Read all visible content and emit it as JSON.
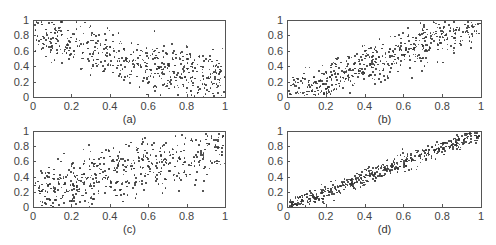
{
  "chart_data": [
    {
      "type": "scatter",
      "caption": "(a)",
      "title": "",
      "xlabel": "",
      "ylabel": "",
      "xlim": [
        0,
        1
      ],
      "ylim": [
        0,
        1
      ],
      "xticks": [
        "0",
        "0.2",
        "0.4",
        "0.6",
        "0.8",
        "1"
      ],
      "yticks": [
        "0",
        "0.2",
        "0.4",
        "0.6",
        "0.8",
        "1"
      ],
      "grid": false,
      "description": "Weak negative correlation; points spread over full unit square, denser top-left and bottom-right",
      "pattern": {
        "kind": "negative",
        "noise": 0.45
      },
      "n_points": 500
    },
    {
      "type": "scatter",
      "caption": "(b)",
      "title": "",
      "xlabel": "",
      "ylabel": "",
      "xlim": [
        0,
        1
      ],
      "ylim": [
        0,
        1
      ],
      "xticks": [
        "0",
        "0.2",
        "0.4",
        "0.6",
        "0.8",
        "1"
      ],
      "yticks": [
        "0",
        "0.2",
        "0.4",
        "0.6",
        "0.8",
        "1"
      ],
      "grid": false,
      "description": "Moderate positive correlation along y = x",
      "pattern": {
        "kind": "positive",
        "noise": 0.22
      },
      "n_points": 500
    },
    {
      "type": "scatter",
      "caption": "(c)",
      "title": "",
      "xlabel": "",
      "ylabel": "",
      "xlim": [
        0,
        1
      ],
      "ylim": [
        0,
        1
      ],
      "xticks": [
        "0",
        "0.2",
        "0.4",
        "0.6",
        "0.8",
        "1"
      ],
      "yticks": [
        "0",
        "0.2",
        "0.4",
        "0.6",
        "0.8",
        "1"
      ],
      "grid": false,
      "description": "Weak positive correlation; wide spread",
      "pattern": {
        "kind": "positive",
        "noise": 0.45
      },
      "n_points": 500
    },
    {
      "type": "scatter",
      "caption": "(d)",
      "title": "",
      "xlabel": "",
      "ylabel": "",
      "xlim": [
        0,
        1
      ],
      "ylim": [
        0,
        1
      ],
      "xticks": [
        "0",
        "0.2",
        "0.4",
        "0.6",
        "0.8",
        "1"
      ],
      "yticks": [
        "0",
        "0.2",
        "0.4",
        "0.6",
        "0.8",
        "1"
      ],
      "grid": false,
      "description": "Strong positive correlation, tight band along y = x",
      "pattern": {
        "kind": "positive",
        "noise": 0.09
      },
      "n_points": 500
    }
  ],
  "layout": {
    "panels": [
      {
        "left": 33,
        "top": 20,
        "width": 193,
        "height": 78
      },
      {
        "left": 287,
        "top": 20,
        "width": 195,
        "height": 78
      },
      {
        "left": 33,
        "top": 131,
        "width": 193,
        "height": 77
      },
      {
        "left": 287,
        "top": 131,
        "width": 195,
        "height": 77
      }
    ],
    "point_color": "#333333"
  }
}
